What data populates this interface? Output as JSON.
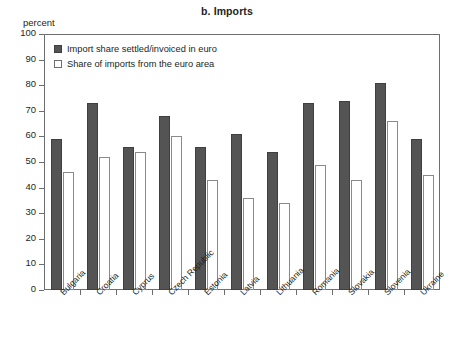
{
  "chart_data": {
    "type": "bar",
    "title": "b. Imports",
    "xlabel": "",
    "ylabel": "percent",
    "ylim": [
      0,
      100
    ],
    "yticks": [
      0,
      10,
      20,
      30,
      40,
      50,
      60,
      70,
      80,
      90,
      100
    ],
    "grid": false,
    "legend_position": "top-left",
    "categories": [
      "Bulgaria",
      "Croatia",
      "Cyprus",
      "Czech Republic",
      "Estonia",
      "Latvia",
      "Lithuania",
      "Romania",
      "Slovakia",
      "Slovenia",
      "Ukraine"
    ],
    "series": [
      {
        "name": "Import share settled/invoiced in euro",
        "color": "#545454",
        "values": [
          59,
          73,
          56,
          68,
          56,
          61,
          54,
          73,
          74,
          81,
          59
        ]
      },
      {
        "name": "Share of imports from the euro area",
        "color": "#ffffff",
        "values": [
          46,
          52,
          54,
          60,
          43,
          36,
          34,
          49,
          43,
          66,
          45
        ]
      }
    ]
  },
  "colors": {
    "series_dark": "#545454",
    "series_light": "#ffffff",
    "axis": "#6d6e70",
    "text": "#231f20",
    "background": "#ffffff"
  }
}
